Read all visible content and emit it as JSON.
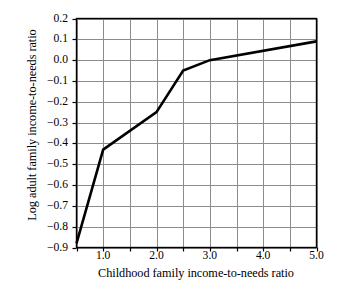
{
  "chart_data": {
    "type": "line",
    "title": "",
    "xlabel": "Childhood family income-to-needs ratio",
    "ylabel": "Log adult family income-to-needs ratio",
    "xlim": [
      0.5,
      5.0
    ],
    "ylim": [
      -0.9,
      0.2
    ],
    "grid": true,
    "legend": null,
    "x_major_ticks": [
      1.0,
      2.0,
      3.0,
      4.0,
      5.0
    ],
    "x_major_tick_labels": [
      "1.0",
      "2.0",
      "3.0",
      "4.0",
      "5.0"
    ],
    "x_minor_ticks": [
      0.5,
      1.5,
      2.5,
      3.5,
      4.5
    ],
    "x_gridlines": [
      0.5,
      1.0,
      1.5,
      2.0,
      2.5,
      3.0,
      3.5,
      4.0,
      4.5,
      5.0
    ],
    "y_ticks": [
      0.2,
      0.1,
      0.0,
      -0.1,
      -0.2,
      -0.3,
      -0.4,
      -0.5,
      -0.6,
      -0.7,
      -0.8,
      -0.9
    ],
    "y_tick_labels": [
      "0.2",
      "0.1",
      "0.0",
      "−0.1",
      "−0.2",
      "−0.3",
      "−0.4",
      "−0.5",
      "−0.6",
      "−0.7",
      "−0.8",
      "−0.9"
    ],
    "y_gridlines": [
      0.2,
      0.1,
      0.0,
      -0.1,
      -0.2,
      -0.3,
      -0.4,
      -0.5,
      -0.6,
      -0.7,
      -0.8,
      -0.9
    ],
    "series": [
      {
        "name": "Log adult family income-to-needs ratio",
        "color": "#000000",
        "line_width": 2.6,
        "x": [
          0.5,
          1.0,
          2.0,
          2.5,
          3.0,
          5.0
        ],
        "y": [
          -0.88,
          -0.43,
          -0.25,
          -0.05,
          0.0,
          0.09
        ],
        "points": [
          [
            0.5,
            -0.88
          ],
          [
            1.0,
            -0.43
          ],
          [
            2.0,
            -0.25
          ],
          [
            2.5,
            -0.05
          ],
          [
            3.0,
            0.0
          ],
          [
            5.0,
            0.09
          ]
        ]
      }
    ],
    "colors": {
      "line": "#000000",
      "grid": "#8c8c8c",
      "axis": "#000000",
      "background": "#ffffff",
      "text": "#000000"
    }
  }
}
